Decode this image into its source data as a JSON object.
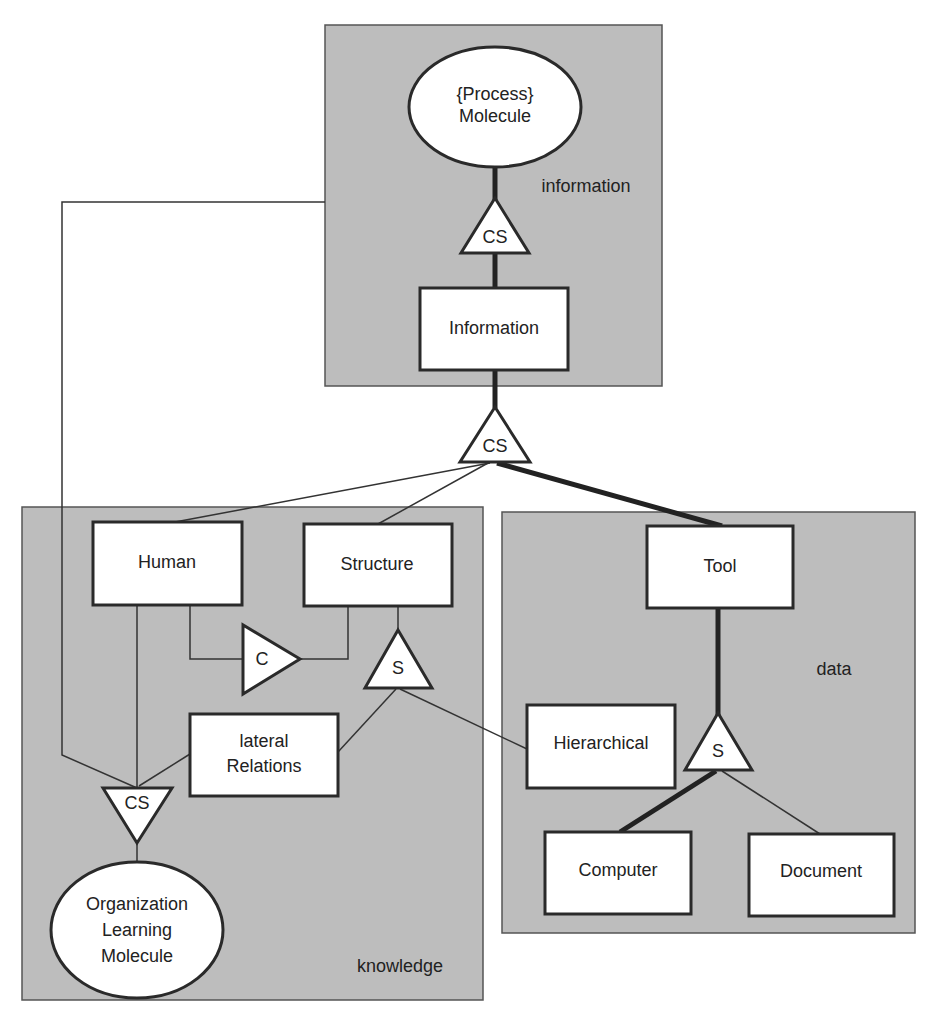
{
  "diagram": {
    "panels": {
      "information": "information",
      "knowledge": "knowledge",
      "data": "data"
    },
    "nodes": {
      "process_molecule": {
        "line1": "{Process}",
        "line2": "Molecule"
      },
      "information": "Information",
      "human": "Human",
      "structure": "Structure",
      "lateral_relations": {
        "line1": "lateral",
        "line2": "Relations"
      },
      "org_learning_molecule": {
        "line1": "Organization",
        "line2": "Learning",
        "line3": "Molecule"
      },
      "tool": "Tool",
      "hierarchical": "Hierarchical",
      "computer": "Computer",
      "document": "Document"
    },
    "connectors": {
      "cs_top": "CS",
      "cs_middle": "CS",
      "c_knowledge": "C",
      "s_knowledge": "S",
      "cs_bottom": "CS",
      "s_data": "S"
    },
    "edges": [
      {
        "from": "process_molecule",
        "to": "cs_top",
        "weight": "thick"
      },
      {
        "from": "cs_top",
        "to": "information",
        "weight": "thick"
      },
      {
        "from": "information",
        "to": "cs_middle",
        "weight": "thick"
      },
      {
        "from": "cs_middle",
        "to": "human",
        "weight": "thin"
      },
      {
        "from": "cs_middle",
        "to": "structure",
        "weight": "thin"
      },
      {
        "from": "cs_middle",
        "to": "tool",
        "weight": "thick"
      },
      {
        "from": "human",
        "to": "c_knowledge",
        "weight": "thin"
      },
      {
        "from": "c_knowledge",
        "to": "structure",
        "weight": "thin"
      },
      {
        "from": "structure",
        "to": "s_knowledge",
        "weight": "thin"
      },
      {
        "from": "s_knowledge",
        "to": "lateral_relations",
        "weight": "thin"
      },
      {
        "from": "s_knowledge",
        "to": "hierarchical",
        "weight": "thin"
      },
      {
        "from": "human",
        "to": "cs_bottom",
        "weight": "thin"
      },
      {
        "from": "lateral_relations",
        "to": "cs_bottom",
        "weight": "thin"
      },
      {
        "from": "process_molecule_panel",
        "to": "cs_bottom",
        "weight": "thin"
      },
      {
        "from": "cs_bottom",
        "to": "org_learning_molecule",
        "weight": "thin"
      },
      {
        "from": "tool",
        "to": "s_data",
        "weight": "thick"
      },
      {
        "from": "s_data",
        "to": "computer",
        "weight": "thick"
      },
      {
        "from": "s_data",
        "to": "document",
        "weight": "thin"
      }
    ]
  }
}
